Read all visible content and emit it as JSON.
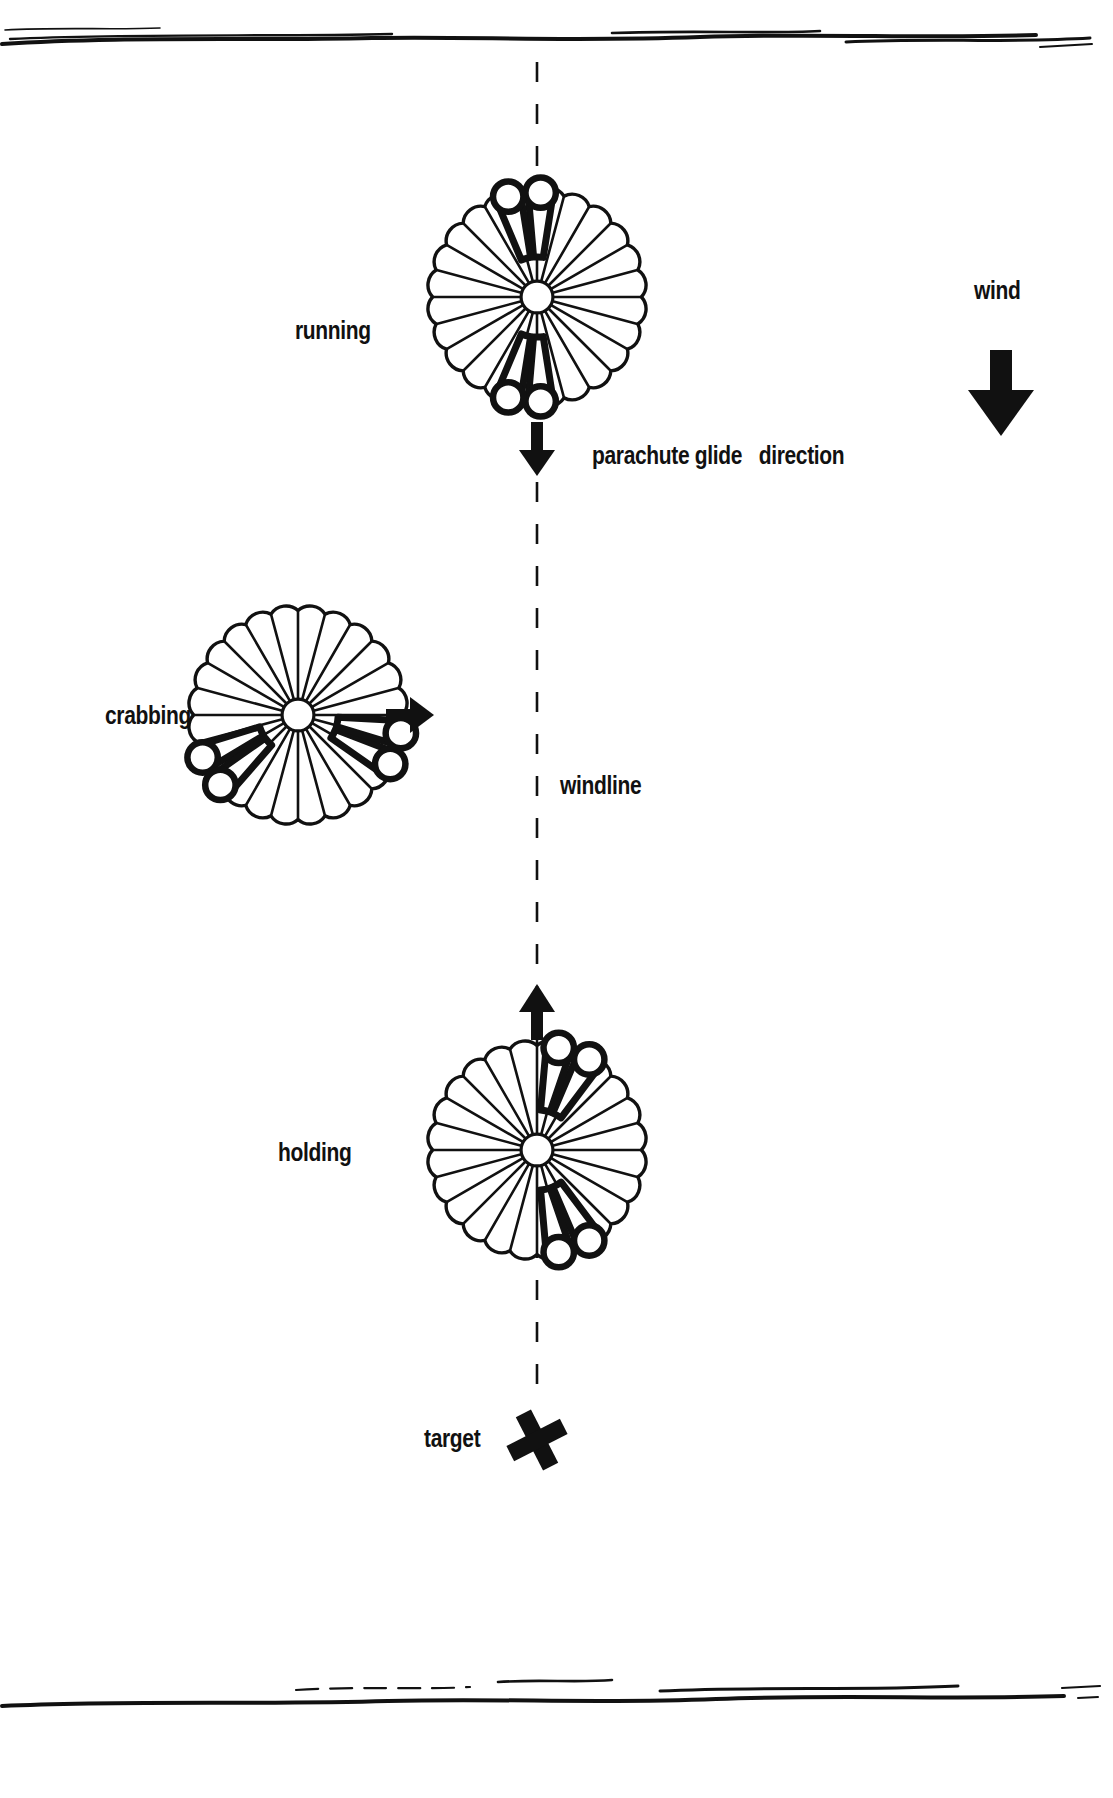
{
  "diagram": {
    "background_color": "#ffffff",
    "ink_color": "#111111",
    "labels": {
      "running": "running",
      "crabbing": "crabbing",
      "holding": "holding",
      "windline": "windline",
      "target": "target",
      "wind": "wind",
      "glide_direction": "parachute glide   direction"
    },
    "canopies": [
      {
        "name": "running",
        "center_x": 537,
        "center_y": 297,
        "radius": 118,
        "gores": 24,
        "slot_angles_deg": [
          178,
          196,
          2,
          344
        ],
        "label": "running"
      },
      {
        "name": "crabbing",
        "center_x": 298,
        "center_y": 715,
        "radius": 118,
        "gores": 24,
        "slot_angles_deg": [
          246,
          228,
          118,
          100
        ],
        "label": "crabbing"
      },
      {
        "name": "holding",
        "center_x": 537,
        "center_y": 1150,
        "radius": 118,
        "gores": 24,
        "slot_angles_deg": [
          150,
          168,
          30,
          12
        ],
        "label": "holding"
      }
    ],
    "windline": {
      "x": 537,
      "y_top": 60,
      "y_bottom": 1400,
      "style": "dashed",
      "label": "windline"
    },
    "arrows": [
      {
        "name": "running-glide-arrow",
        "direction": "down",
        "x": 537,
        "y_from": 424,
        "y_to": 470
      },
      {
        "name": "crabbing-glide-arrow",
        "direction": "right",
        "y": 715,
        "x_from": 388,
        "x_to": 424
      },
      {
        "name": "holding-glide-arrow",
        "direction": "up",
        "x": 537,
        "y_from": 1030,
        "y_to": 984
      },
      {
        "name": "wind-arrow",
        "direction": "down",
        "x": 1000,
        "y_from": 352,
        "y_to": 432
      }
    ],
    "target_mark": {
      "name": "target-x",
      "x": 537,
      "y": 1440,
      "glyph": "X"
    },
    "page_rules": {
      "top_y": 42,
      "bottom_y": 1700,
      "style": "hand-drawn"
    }
  }
}
